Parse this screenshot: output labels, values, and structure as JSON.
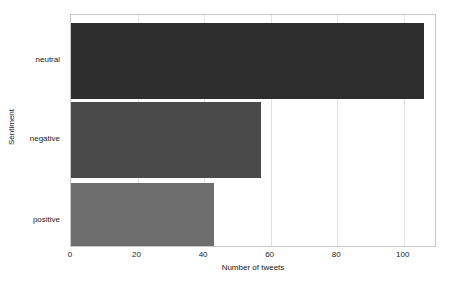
{
  "chart_data": {
    "type": "bar",
    "orientation": "horizontal",
    "title": "",
    "xlabel": "Number of tweets",
    "ylabel": "Sentiment",
    "categories": [
      "neutral",
      "negative",
      "positive"
    ],
    "values": [
      106,
      57,
      43
    ],
    "bar_colors": [
      "#2e2e2e",
      "#4a4a4a",
      "#6e6e6e"
    ],
    "xlim": [
      0,
      110
    ],
    "ylim": [
      0,
      3
    ],
    "xticks": [
      0,
      20,
      40,
      60,
      80,
      100
    ],
    "xtick_labels": [
      "0",
      "20",
      "40",
      "60",
      "80",
      "100"
    ],
    "grid": "vertical",
    "legend": "none",
    "background": "#ffffff",
    "frame_color": "#c8c8c8",
    "gridline_color": "#e2e2e2"
  }
}
